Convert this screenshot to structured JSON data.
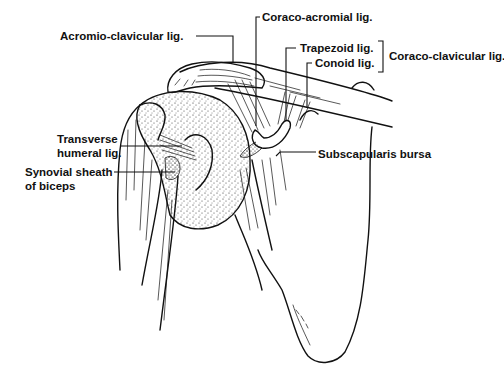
{
  "figure": {
    "ink_color": "#111111",
    "background": "#ffffff"
  },
  "labels": {
    "acromio_clavicular": "Acromio-clavicular lig.",
    "coraco_acromial": "Coraco-acromial lig.",
    "trapezoid": "Trapezoid lig.",
    "conoid": "Conoid lig.",
    "coraco_clavicular": "Coraco-clavicular lig.",
    "transverse_humeral_line1": "Transverse",
    "transverse_humeral_line2": "humeral lig.",
    "synovial_sheath_line1": "Synovial sheath",
    "synovial_sheath_line2": "of biceps",
    "subscapularis_bursa": "Subscapularis bursa"
  }
}
